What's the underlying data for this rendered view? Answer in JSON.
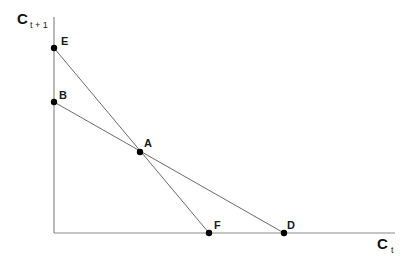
{
  "diagram": {
    "y_axis": {
      "label": "C",
      "subscript": "t + 1"
    },
    "x_axis": {
      "label": "C",
      "subscript": "t"
    },
    "points": [
      {
        "id": "E",
        "label": "E",
        "x": 54,
        "y": 48
      },
      {
        "id": "B",
        "label": "B",
        "x": 54,
        "y": 102
      },
      {
        "id": "A",
        "label": "A",
        "x": 140,
        "y": 152
      },
      {
        "id": "F",
        "label": "F",
        "x": 209,
        "y": 233
      },
      {
        "id": "D",
        "label": "D",
        "x": 284,
        "y": 233
      }
    ],
    "lines": [
      {
        "from": "E",
        "to": "F"
      },
      {
        "from": "B",
        "to": "D"
      }
    ],
    "colors": {
      "axis": "#8a8a8a",
      "line": "#6a6a6a",
      "point": "#000000",
      "text": "#1a1a1a"
    }
  }
}
